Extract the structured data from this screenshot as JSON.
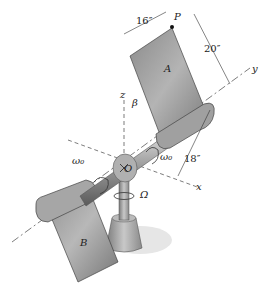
{
  "diagram": {
    "labels": {
      "plate_a": "A",
      "plate_b": "B",
      "point_p": "P",
      "origin": "O",
      "axis_x": "x",
      "axis_y": "y",
      "axis_z": "z",
      "angle": "β",
      "omega_left": "ω₀",
      "omega_right": "ω₀",
      "omega_cap": "Ω"
    },
    "dimensions": {
      "width": "16″",
      "height": "20″",
      "offset": "18″"
    },
    "colors": {
      "metal_light": "#c9c9c9",
      "metal_mid": "#9c9c9c",
      "metal_dark": "#6e6e6e",
      "line": "#333333"
    }
  }
}
